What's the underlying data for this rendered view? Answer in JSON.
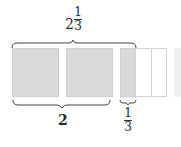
{
  "diagram": {
    "top_label": {
      "whole": "2",
      "numerator": "1",
      "denominator": "3"
    },
    "bottom_left_label": "2",
    "bottom_right_label": {
      "numerator": "1",
      "denominator": "3"
    },
    "units": [
      {
        "name": "whole-1",
        "shaded": true
      },
      {
        "name": "whole-2",
        "shaded": true
      },
      {
        "name": "third-unit",
        "parts": 3,
        "shaded_parts": 1
      }
    ],
    "colors": {
      "shaded": "#d9d9d9",
      "empty": "#ffffff",
      "border": "#cfcfcf",
      "ink": "#2a2a2a"
    }
  }
}
